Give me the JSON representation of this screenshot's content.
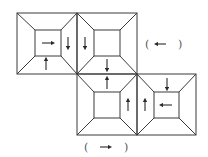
{
  "diagram": {
    "type": "cube-net-frames",
    "stroke_color": "#3a3a3a",
    "squares": [
      {
        "id": "A",
        "x": 17,
        "y": 13,
        "size": 60,
        "inner": {
          "x": 35,
          "y": 30,
          "size": 26
        }
      },
      {
        "id": "B",
        "x": 77,
        "y": 13,
        "size": 60,
        "inner": {
          "x": 94,
          "y": 30,
          "size": 26
        }
      },
      {
        "id": "C",
        "x": 77,
        "y": 74,
        "size": 61,
        "inner": {
          "x": 94,
          "y": 92,
          "size": 26
        }
      },
      {
        "id": "D",
        "x": 137,
        "y": 74,
        "size": 59,
        "inner": {
          "x": 154,
          "y": 92,
          "size": 25
        }
      }
    ],
    "arrows": [
      {
        "square": "A",
        "face": "center",
        "direction": "right",
        "x": 48,
        "y": 43
      },
      {
        "square": "A",
        "face": "right",
        "direction": "down",
        "x": 68,
        "y": 43
      },
      {
        "square": "A",
        "face": "bottom",
        "direction": "up",
        "x": 46,
        "y": 64
      },
      {
        "square": "B",
        "face": "left",
        "direction": "down",
        "x": 85,
        "y": 43
      },
      {
        "square": "B",
        "face": "bottom",
        "direction": "down",
        "x": 107,
        "y": 65
      },
      {
        "square": "C",
        "face": "top",
        "direction": "up",
        "x": 107,
        "y": 83
      },
      {
        "square": "C",
        "face": "right",
        "direction": "up",
        "x": 128,
        "y": 105
      },
      {
        "square": "D",
        "face": "left",
        "direction": "up",
        "x": 145,
        "y": 105
      },
      {
        "square": "D",
        "face": "top",
        "direction": "down",
        "x": 167,
        "y": 84
      },
      {
        "square": "D",
        "face": "center",
        "direction": "left",
        "x": 166,
        "y": 105
      }
    ],
    "answer_blanks": [
      {
        "label": "(  ←  )",
        "open": "(",
        "symbol": "←",
        "close": ")",
        "x": 154,
        "y": 44
      },
      {
        "label": "(  →  )",
        "open": "(",
        "symbol": "→",
        "close": ")",
        "x": 95,
        "y": 150
      }
    ]
  }
}
